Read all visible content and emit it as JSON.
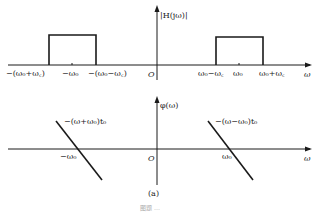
{
  "figure": {
    "caption": "(a)",
    "footer": "图题 …"
  },
  "top_plot": {
    "ylabel": "|H(jω)|",
    "xlabel": "ω",
    "origin": "O",
    "ticks": {
      "neg_outer": "−(ω₀+ω꜀)",
      "neg_center": "−ω₀",
      "neg_inner": "−(ω₀−ω꜀)",
      "pos_inner": "ω₀−ω꜀",
      "pos_center": "ω₀",
      "pos_outer": "ω₀+ω꜀"
    }
  },
  "bottom_plot": {
    "ylabel": "φ(ω)",
    "xlabel": "ω",
    "origin": "O",
    "left_line_label": "−(ω+ω₀)t₀",
    "right_line_label": "−(ω−ω₀)t₀",
    "left_zero": "−ω₀",
    "right_zero": "ω₀"
  },
  "colors": {
    "ink": "#1a1a1a",
    "bg": "#ffffff"
  }
}
